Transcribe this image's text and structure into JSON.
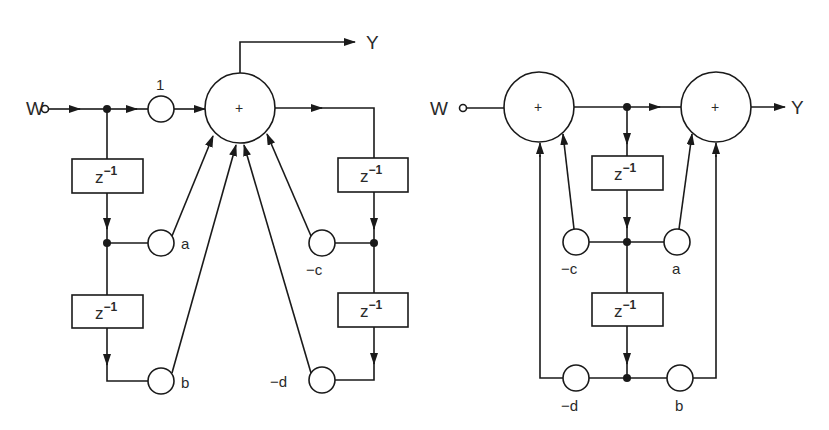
{
  "diagram_title": "",
  "colors": {
    "stroke": "#1a1a1a",
    "background": "#ffffff",
    "text": "#2a2a2a"
  },
  "left_diagram": {
    "input_label": "W",
    "output_label": "Y",
    "gain_direct_label": "1",
    "summer_symbol": "+",
    "delay_label_base": "z",
    "delay_label_exp": "−1",
    "coefficients": {
      "a": "a",
      "b": "b",
      "c": "−c",
      "d": "−d"
    }
  },
  "right_diagram": {
    "input_label": "W",
    "output_label": "Y",
    "summer1_symbol": "+",
    "summer2_symbol": "+",
    "delay_label_base": "z",
    "delay_label_exp": "−1",
    "coefficients": {
      "a": "a",
      "b": "b",
      "c": "−c",
      "d": "−d"
    }
  }
}
